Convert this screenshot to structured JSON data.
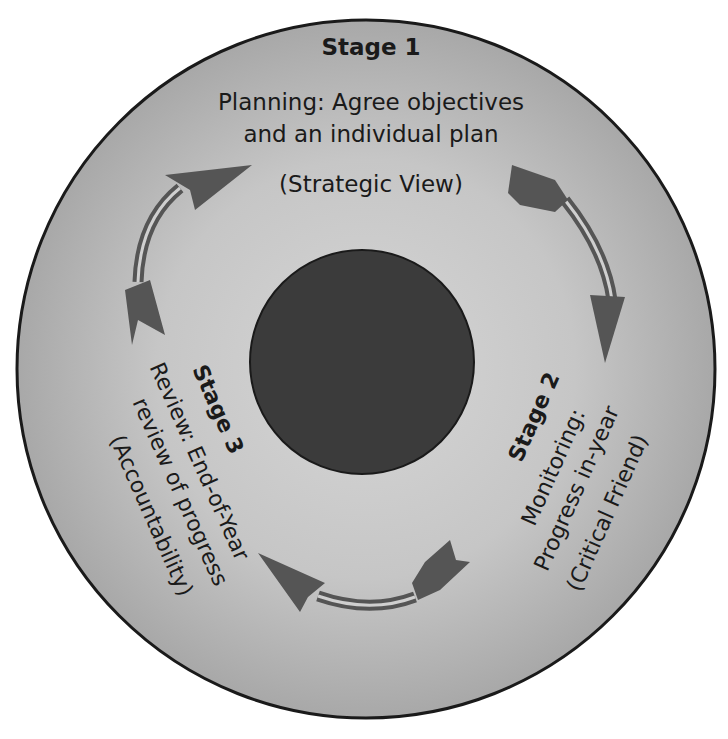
{
  "diagram": {
    "type": "cycle",
    "colors": {
      "outer_ring_edge": "#9a9a9a",
      "outer_ring_center": "#d4d4d4",
      "outline": "#1a1a1a",
      "core": "#3a3a3a",
      "arrow": "#555555",
      "text": "#1a1a1a"
    },
    "stages": [
      {
        "title": "Stage 1",
        "lines": [
          "Planning: Agree objectives",
          "and an individual plan"
        ],
        "role": "(Strategic View)"
      },
      {
        "title": "Stage 2",
        "lines": [
          "Monitoring:",
          "Progress in-year"
        ],
        "role": "(Critical Friend)"
      },
      {
        "title": "Stage 3",
        "lines": [
          "Review: End-of-Year",
          "review of progress"
        ],
        "role": "(Accountability)"
      }
    ],
    "arrows": [
      {
        "from": "Stage 1",
        "to": "Stage 2",
        "direction": "clockwise"
      },
      {
        "from": "Stage 2",
        "to": "Stage 3",
        "direction": "clockwise"
      },
      {
        "from": "Stage 3",
        "to": "Stage 1",
        "direction": "clockwise"
      }
    ]
  }
}
